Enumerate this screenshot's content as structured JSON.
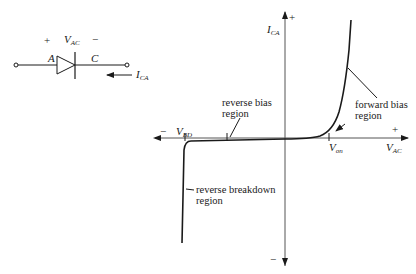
{
  "circuit": {
    "plus_sign": "+",
    "minus_sign": "−",
    "voltage_label": "V",
    "voltage_sub": "AC",
    "anode_label": "A",
    "cathode_label": "C",
    "current_label": "I",
    "current_sub": "CA"
  },
  "graph": {
    "y_axis_label": "I",
    "y_axis_sub": "CA",
    "y_plus": "+",
    "y_minus": "−",
    "x_axis_label": "V",
    "x_axis_sub": "AC",
    "x_plus": "+",
    "x_minus": "−",
    "vbd_label": "V",
    "vbd_sub": "BD",
    "von_label": "V",
    "von_sub": "on",
    "annotations": {
      "reverse_bias": [
        "reverse bias",
        "region"
      ],
      "forward_bias": [
        "forward bias",
        "region"
      ],
      "reverse_breakdown": [
        "reverse breakdown",
        "region"
      ]
    }
  },
  "colors": {
    "line": "#1a1a1a",
    "axis": "#555555",
    "background": "#ffffff"
  }
}
